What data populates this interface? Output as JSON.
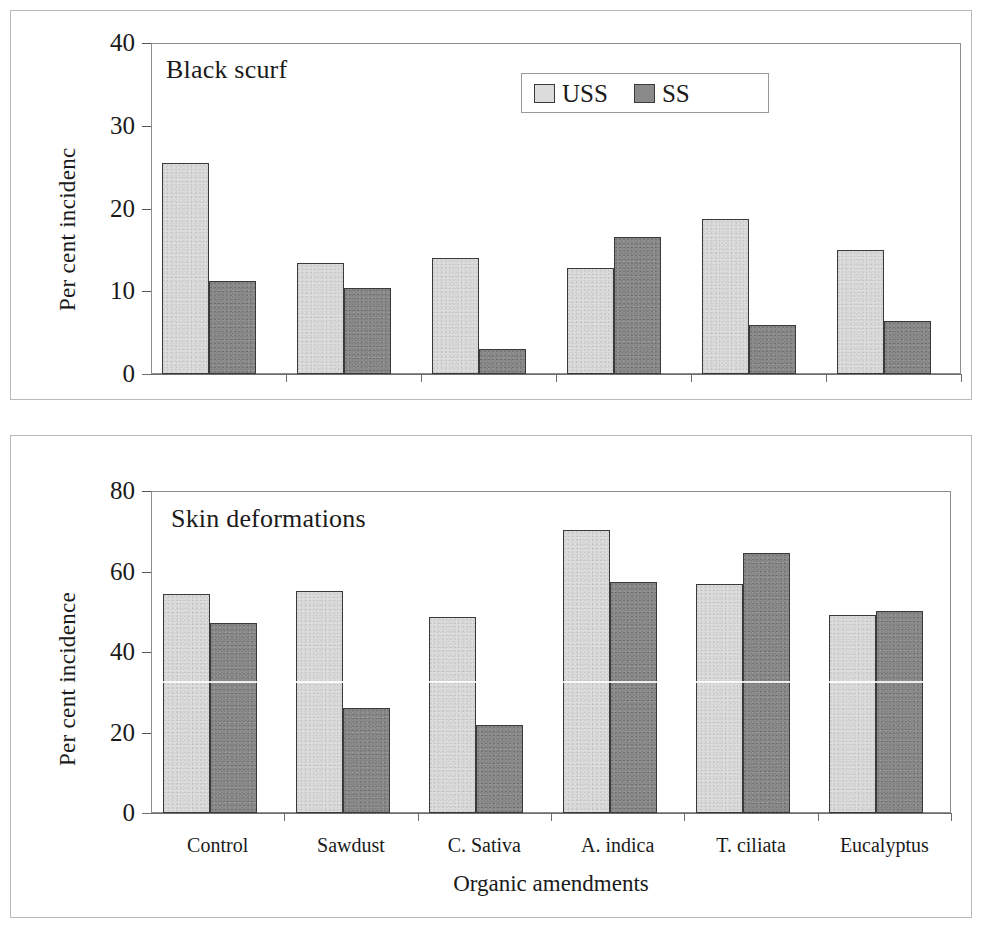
{
  "figure": {
    "xlabel": "Organic amendments",
    "categories": [
      "Control",
      "Sawdust",
      "C. Sativa",
      "A. indica",
      "T. ciliata",
      "Eucalyptus"
    ],
    "legend": {
      "entries": [
        {
          "label": "USS",
          "color": "#dcdcdc"
        },
        {
          "label": "SS",
          "color": "#8a8a8a"
        }
      ]
    }
  },
  "chart_data": [
    {
      "type": "bar",
      "title": "Black scurf",
      "panel": "top",
      "xlabel": "",
      "ylabel": "Per cent incidence",
      "ylabel_rendered": "Per cent incidenc",
      "ylim": [
        0,
        40
      ],
      "yticks": [
        0,
        10,
        20,
        30,
        40
      ],
      "ytick_labels": [
        "0",
        "10",
        "20",
        "30",
        "40"
      ],
      "grid": false,
      "legend_position": "top-center-right",
      "categories": [
        "Control",
        "Sawdust",
        "C. Sativa",
        "A. indica",
        "T. ciliata",
        "Eucalyptus"
      ],
      "series": [
        {
          "name": "USS",
          "color": "#dcdcdc",
          "values": [
            25.5,
            13.4,
            14.0,
            12.8,
            18.7,
            15.0
          ]
        },
        {
          "name": "SS",
          "color": "#8a8a8a",
          "values": [
            11.2,
            10.4,
            3.0,
            16.6,
            5.9,
            6.4
          ]
        }
      ]
    },
    {
      "type": "bar",
      "title": "Skin deformations",
      "panel": "bottom",
      "xlabel": "Organic amendments",
      "ylabel": "Per cent incidence",
      "ylabel_rendered": "Per cent incidence",
      "ylim": [
        0,
        80
      ],
      "yticks": [
        0,
        20,
        40,
        60,
        80
      ],
      "ytick_labels": [
        "0",
        "20",
        "40",
        "60",
        "80"
      ],
      "grid": false,
      "legend_position": "none",
      "categories": [
        "Control",
        "Sawdust",
        "C. Sativa",
        "A. indica",
        "T. ciliata",
        "Eucalyptus"
      ],
      "series": [
        {
          "name": "USS",
          "color": "#dcdcdc",
          "values": [
            54.3,
            55.2,
            48.8,
            70.2,
            56.8,
            49.3
          ]
        },
        {
          "name": "SS",
          "color": "#8a8a8a",
          "values": [
            47.3,
            26.0,
            21.8,
            57.5,
            64.5,
            50.3
          ]
        }
      ]
    }
  ]
}
